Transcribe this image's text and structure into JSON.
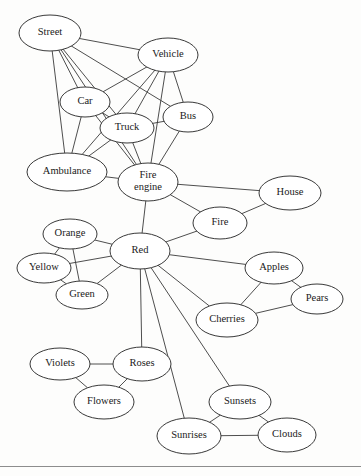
{
  "figure": {
    "type": "semantic-network-diagram",
    "background_color": "#fdfdfc",
    "node_fill": "#ffffff",
    "node_stroke": "#2e2e2e",
    "edge_color": "#3a3a3a",
    "label_color": "#1a1a1a"
  },
  "nodes": [
    {
      "id": "street",
      "label": "Street",
      "x": 50,
      "y": 33,
      "rx": 31,
      "ry": 18,
      "font_size": 10.5,
      "lines": [
        "Street"
      ]
    },
    {
      "id": "vehicle",
      "label": "Vehicle",
      "x": 168,
      "y": 55,
      "rx": 30,
      "ry": 17,
      "font_size": 10.5,
      "lines": [
        "Vehicle"
      ]
    },
    {
      "id": "car",
      "label": "Car",
      "x": 85,
      "y": 102,
      "rx": 25,
      "ry": 15,
      "font_size": 10.5,
      "lines": [
        "Car"
      ]
    },
    {
      "id": "bus",
      "label": "Bus",
      "x": 188,
      "y": 117,
      "rx": 25,
      "ry": 15,
      "font_size": 10.5,
      "lines": [
        "Bus"
      ]
    },
    {
      "id": "truck",
      "label": "Truck",
      "x": 127,
      "y": 128,
      "rx": 27,
      "ry": 15,
      "font_size": 10.5,
      "lines": [
        "Truck"
      ]
    },
    {
      "id": "ambulance",
      "label": "Ambulance",
      "x": 67,
      "y": 172,
      "rx": 40,
      "ry": 19,
      "font_size": 10.5,
      "lines": [
        "Ambulance"
      ]
    },
    {
      "id": "fire_engine",
      "label": "Fire engine",
      "x": 148,
      "y": 182,
      "rx": 30,
      "ry": 19,
      "font_size": 10.5,
      "lines": [
        "Fire",
        "engine"
      ]
    },
    {
      "id": "house",
      "label": "House",
      "x": 290,
      "y": 193,
      "rx": 31,
      "ry": 17,
      "font_size": 10.5,
      "lines": [
        "House"
      ]
    },
    {
      "id": "fire",
      "label": "Fire",
      "x": 220,
      "y": 223,
      "rx": 27,
      "ry": 16,
      "font_size": 10.5,
      "lines": [
        "Fire"
      ]
    },
    {
      "id": "orange",
      "label": "Orange",
      "x": 70,
      "y": 234,
      "rx": 27,
      "ry": 15,
      "font_size": 10.5,
      "lines": [
        "Orange"
      ]
    },
    {
      "id": "red",
      "label": "Red",
      "x": 140,
      "y": 251,
      "rx": 30,
      "ry": 18,
      "font_size": 10.5,
      "lines": [
        "Red"
      ]
    },
    {
      "id": "yellow",
      "label": "Yellow",
      "x": 44,
      "y": 268,
      "rx": 27,
      "ry": 15,
      "font_size": 10.5,
      "lines": [
        "Yellow"
      ]
    },
    {
      "id": "apples",
      "label": "Apples",
      "x": 274,
      "y": 268,
      "rx": 29,
      "ry": 16,
      "font_size": 10.5,
      "lines": [
        "Apples"
      ]
    },
    {
      "id": "green",
      "label": "Green",
      "x": 82,
      "y": 295,
      "rx": 26,
      "ry": 14,
      "font_size": 10.5,
      "lines": [
        "Green"
      ]
    },
    {
      "id": "pears",
      "label": "Pears",
      "x": 317,
      "y": 299,
      "rx": 26,
      "ry": 15,
      "font_size": 10.5,
      "lines": [
        "Pears"
      ]
    },
    {
      "id": "cherries",
      "label": "Cherries",
      "x": 227,
      "y": 320,
      "rx": 31,
      "ry": 17,
      "font_size": 10.5,
      "lines": [
        "Cherries"
      ]
    },
    {
      "id": "violets",
      "label": "Violets",
      "x": 60,
      "y": 364,
      "rx": 30,
      "ry": 16,
      "font_size": 10.5,
      "lines": [
        "Violets"
      ]
    },
    {
      "id": "roses",
      "label": "Roses",
      "x": 142,
      "y": 364,
      "rx": 29,
      "ry": 17,
      "font_size": 10.5,
      "lines": [
        "Roses"
      ]
    },
    {
      "id": "flowers",
      "label": "Flowers",
      "x": 104,
      "y": 402,
      "rx": 30,
      "ry": 17,
      "font_size": 10.5,
      "lines": [
        "Flowers"
      ]
    },
    {
      "id": "sunsets",
      "label": "Sunsets",
      "x": 240,
      "y": 402,
      "rx": 31,
      "ry": 17,
      "font_size": 10.5,
      "lines": [
        "Sunsets"
      ]
    },
    {
      "id": "sunrises",
      "label": "Sunrises",
      "x": 189,
      "y": 436,
      "rx": 32,
      "ry": 18,
      "font_size": 10.5,
      "lines": [
        "Sunrises"
      ]
    },
    {
      "id": "clouds",
      "label": "Clouds",
      "x": 287,
      "y": 435,
      "rx": 29,
      "ry": 17,
      "font_size": 10.5,
      "lines": [
        "Clouds"
      ]
    }
  ],
  "edges": [
    {
      "from": "street",
      "to": "vehicle"
    },
    {
      "from": "street",
      "to": "car"
    },
    {
      "from": "street",
      "to": "bus"
    },
    {
      "from": "street",
      "to": "truck"
    },
    {
      "from": "street",
      "to": "ambulance"
    },
    {
      "from": "street",
      "to": "fire_engine"
    },
    {
      "from": "vehicle",
      "to": "car"
    },
    {
      "from": "vehicle",
      "to": "bus"
    },
    {
      "from": "vehicle",
      "to": "truck"
    },
    {
      "from": "vehicle",
      "to": "ambulance"
    },
    {
      "from": "vehicle",
      "to": "fire_engine"
    },
    {
      "from": "car",
      "to": "truck"
    },
    {
      "from": "car",
      "to": "ambulance"
    },
    {
      "from": "car",
      "to": "fire_engine"
    },
    {
      "from": "truck",
      "to": "ambulance"
    },
    {
      "from": "truck",
      "to": "fire_engine"
    },
    {
      "from": "bus",
      "to": "fire_engine"
    },
    {
      "from": "bus",
      "to": "truck"
    },
    {
      "from": "ambulance",
      "to": "fire_engine"
    },
    {
      "from": "fire_engine",
      "to": "house"
    },
    {
      "from": "fire_engine",
      "to": "fire"
    },
    {
      "from": "fire_engine",
      "to": "red"
    },
    {
      "from": "fire",
      "to": "house"
    },
    {
      "from": "fire",
      "to": "red"
    },
    {
      "from": "orange",
      "to": "yellow"
    },
    {
      "from": "orange",
      "to": "green"
    },
    {
      "from": "orange",
      "to": "red"
    },
    {
      "from": "yellow",
      "to": "green"
    },
    {
      "from": "yellow",
      "to": "red"
    },
    {
      "from": "green",
      "to": "red"
    },
    {
      "from": "red",
      "to": "apples"
    },
    {
      "from": "red",
      "to": "cherries"
    },
    {
      "from": "red",
      "to": "roses"
    },
    {
      "from": "red",
      "to": "sunsets"
    },
    {
      "from": "red",
      "to": "sunrises"
    },
    {
      "from": "apples",
      "to": "pears"
    },
    {
      "from": "apples",
      "to": "cherries"
    },
    {
      "from": "cherries",
      "to": "pears"
    },
    {
      "from": "violets",
      "to": "roses"
    },
    {
      "from": "violets",
      "to": "flowers"
    },
    {
      "from": "roses",
      "to": "flowers"
    },
    {
      "from": "sunsets",
      "to": "sunrises"
    },
    {
      "from": "sunsets",
      "to": "clouds"
    },
    {
      "from": "sunrises",
      "to": "clouds"
    }
  ],
  "footer": {
    "rule_y": 466,
    "rule_color": "#8d8d8d"
  }
}
